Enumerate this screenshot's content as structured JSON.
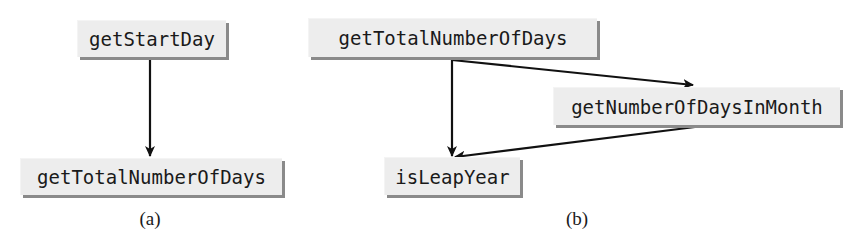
{
  "diagram": {
    "type": "method-call-graph",
    "panels": [
      {
        "id": "a",
        "caption": "(a)",
        "nodes": [
          {
            "id": "getStartDay",
            "label": "getStartDay"
          },
          {
            "id": "getTotalNumberOfDays_a",
            "label": "getTotalNumberOfDays"
          }
        ],
        "edges": [
          {
            "from": "getStartDay",
            "to": "getTotalNumberOfDays_a"
          }
        ]
      },
      {
        "id": "b",
        "caption": "(b)",
        "nodes": [
          {
            "id": "getTotalNumberOfDays_b",
            "label": "getTotalNumberOfDays"
          },
          {
            "id": "getNumberOfDaysInMonth",
            "label": "getNumberOfDaysInMonth"
          },
          {
            "id": "isLeapYear",
            "label": "isLeapYear"
          }
        ],
        "edges": [
          {
            "from": "getTotalNumberOfDays_b",
            "to": "getNumberOfDaysInMonth"
          },
          {
            "from": "getTotalNumberOfDays_b",
            "to": "isLeapYear"
          },
          {
            "from": "getNumberOfDaysInMonth",
            "to": "isLeapYear"
          }
        ]
      }
    ]
  },
  "colors": {
    "node_fill": "#ededed",
    "node_shadow": "#8a8a8a",
    "edge": "#111111",
    "text": "#1a1a1a"
  }
}
